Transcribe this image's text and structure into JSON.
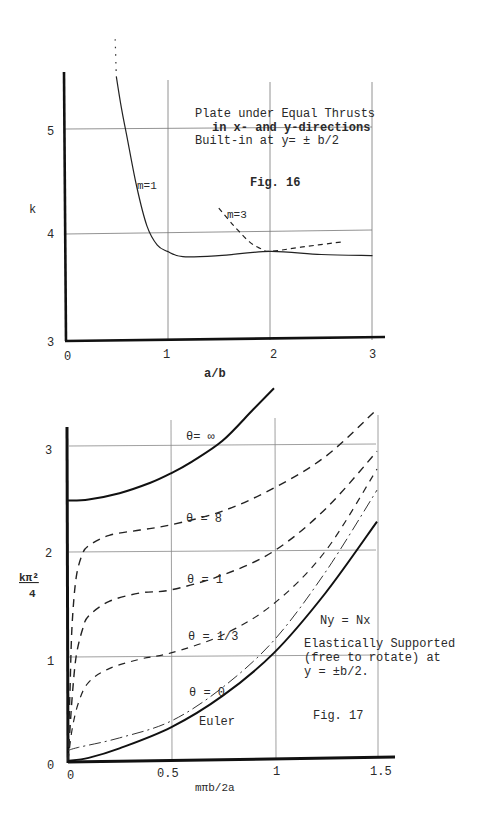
{
  "chart_data": [
    {
      "type": "line",
      "figure_label": "Fig. 16",
      "title": "Plate under Equal Thrusts in x- and y-directions Built-in at y= ± b/2",
      "title_lines": [
        "Plate under Equal Thrusts",
        "in x- and y-directions",
        "Built-in at y= ± b/2"
      ],
      "xlabel": "a/b",
      "ylabel": "k",
      "xlim": [
        0,
        3
      ],
      "ylim": [
        3,
        5.5
      ],
      "xticks": [
        "0",
        "1",
        "2",
        "3"
      ],
      "yticks": [
        "3",
        "4",
        "5"
      ],
      "grid": true,
      "series": [
        {
          "name": "m=1",
          "style": "solid",
          "x": [
            0.5,
            0.55,
            0.6,
            0.7,
            0.8,
            0.9,
            1.0,
            1.15,
            1.5,
            2.0,
            2.5,
            3.0
          ],
          "values": [
            5.5,
            5.2,
            4.95,
            4.45,
            4.08,
            3.9,
            3.84,
            3.79,
            3.8,
            3.84,
            3.81,
            3.8
          ]
        },
        {
          "name": "m=1 (extension)",
          "style": "dotted",
          "x": [
            0.49,
            0.5
          ],
          "values": [
            5.85,
            5.5
          ]
        },
        {
          "name": "m=3",
          "style": "dashed",
          "x": [
            1.5,
            1.65,
            1.8,
            1.9,
            2.0,
            2.3,
            2.7
          ],
          "values": [
            4.25,
            4.08,
            3.93,
            3.87,
            3.84,
            3.88,
            3.93
          ]
        }
      ]
    },
    {
      "type": "line",
      "figure_label": "Fig. 17",
      "title": "Ny = Nx Elastically Supported (free to rotate) at y = ±b/2.",
      "annotation_lines": [
        "Ny = Nx",
        "Elastically Supported",
        "(free to rotate) at",
        "y = ±b/2."
      ],
      "xlabel": "mπb/2a",
      "ylabel": "kπ²/4",
      "xlim": [
        0,
        1.5
      ],
      "ylim": [
        0,
        3.3
      ],
      "xticks": [
        "0",
        "0.5",
        "1",
        "1.5"
      ],
      "yticks": [
        "0",
        "1",
        "2",
        "3"
      ],
      "grid": true,
      "series": [
        {
          "name": "θ = ∞",
          "style": "solid-bold",
          "x": [
            0,
            0.1,
            0.25,
            0.4,
            0.5,
            0.6,
            0.75,
            0.9,
            1.0
          ],
          "values": [
            2.48,
            2.49,
            2.55,
            2.65,
            2.74,
            2.85,
            3.05,
            3.35,
            3.55
          ]
        },
        {
          "name": "θ = 8",
          "style": "dashed",
          "x": [
            0.0,
            0.01,
            0.02,
            0.04,
            0.07,
            0.1,
            0.2,
            0.35,
            0.5,
            0.75,
            1.0,
            1.25,
            1.5
          ],
          "values": [
            0.0,
            0.7,
            1.3,
            1.75,
            1.97,
            2.05,
            2.15,
            2.2,
            2.25,
            2.38,
            2.6,
            2.9,
            3.35
          ]
        },
        {
          "name": "θ = 1",
          "style": "dashed",
          "x": [
            0.0,
            0.02,
            0.04,
            0.07,
            0.1,
            0.2,
            0.35,
            0.5,
            0.75,
            1.0,
            1.25,
            1.5
          ],
          "values": [
            0.0,
            0.6,
            1.0,
            1.25,
            1.38,
            1.52,
            1.6,
            1.63,
            1.77,
            2.0,
            2.4,
            2.95
          ]
        },
        {
          "name": "θ = 1/3",
          "style": "dashed",
          "x": [
            0.0,
            0.02,
            0.05,
            0.1,
            0.2,
            0.35,
            0.5,
            0.75,
            1.0,
            1.25,
            1.5
          ],
          "values": [
            0.0,
            0.3,
            0.55,
            0.75,
            0.88,
            0.97,
            1.03,
            1.2,
            1.5,
            2.0,
            2.78
          ]
        },
        {
          "name": "θ = 0",
          "style": "dash-dot",
          "x": [
            0.0,
            0.05,
            0.25,
            0.5,
            0.75,
            1.0,
            1.25,
            1.5
          ],
          "values": [
            0.1,
            0.13,
            0.22,
            0.38,
            0.7,
            1.15,
            1.8,
            2.58
          ]
        },
        {
          "name": "Euler",
          "style": "solid-bold",
          "x": [
            0.0,
            0.1,
            0.25,
            0.5,
            0.75,
            1.0,
            1.25,
            1.5
          ],
          "values": [
            0.0,
            0.03,
            0.12,
            0.32,
            0.62,
            1.03,
            1.6,
            2.28
          ]
        }
      ]
    }
  ],
  "fig16": {
    "title_line1": "Plate under Equal Thrusts",
    "title_line2": "in x- and y-directions",
    "title_line3": "Built-in at y= ± b/2",
    "fig_label": "Fig. 16",
    "ylabel": "k",
    "xlabel": "a/b",
    "label_m1": "m=1",
    "label_m3": "m=3",
    "xtick0": "0",
    "xtick1": "1",
    "xtick2": "2",
    "xtick3": "3",
    "ytick3": "3",
    "ytick4": "4",
    "ytick5": "5"
  },
  "fig17": {
    "fig_label": "Fig. 17",
    "ylabel_num": "kπ²",
    "ylabel_den": "4",
    "xlabel": "mπb/2a",
    "label_inf": "θ= ∞",
    "label_8": "θ = 8",
    "label_1": "θ = 1",
    "label_third": "θ = 1/3",
    "label_0": "θ = 0",
    "label_euler": "Euler",
    "ann1": "Ny = Nx",
    "ann2": "Elastically Supported",
    "ann3": "(free to rotate) at",
    "ann4": "y = ±b/2.",
    "xtick0": "0",
    "xtick05": "0.5",
    "xtick1": "1",
    "xtick15": "1.5",
    "ytick0": "0",
    "ytick1": "1",
    "ytick2": "2",
    "ytick3": "3"
  }
}
